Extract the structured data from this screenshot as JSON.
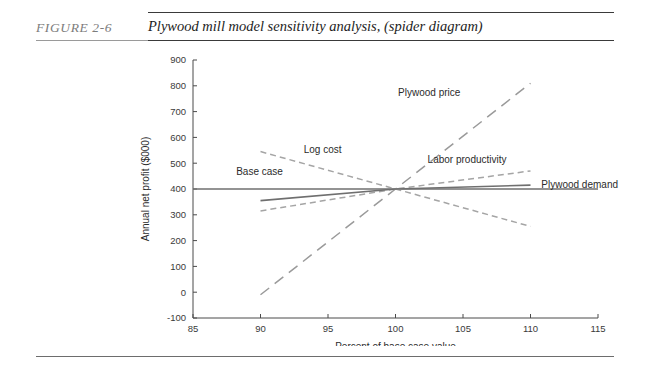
{
  "figure": {
    "number": "FIGURE  2-6",
    "caption": "Plywood mill model sensitivity analysis, (spider diagram)"
  },
  "chart_data": {
    "type": "line",
    "title": "Plywood mill model sensitivity analysis, (spider diagram)",
    "xlabel": "Percent of base case value",
    "ylabel": "Annual net profit ($000)",
    "xlim": [
      85,
      115
    ],
    "ylim": [
      -100,
      900
    ],
    "xticks": [
      85,
      90,
      95,
      100,
      105,
      110,
      115
    ],
    "xtick_labels": [
      "85",
      "90",
      "95",
      "100",
      "105",
      "110",
      "115"
    ],
    "yticks": [
      -100,
      0,
      100,
      200,
      300,
      400,
      500,
      600,
      700,
      800,
      900
    ],
    "ytick_labels": [
      "-100",
      "0",
      "100",
      "200",
      "300",
      "400",
      "500",
      "600",
      "700",
      "800",
      "900"
    ],
    "grid": false,
    "legend": "inline-annotations",
    "base_case_value": 400,
    "series": [
      {
        "name": "Base case",
        "label": "Base case",
        "style": "solid",
        "color": "#6f6f6f",
        "x": [
          85,
          115
        ],
        "y": [
          400,
          400
        ],
        "label_x": 88.2,
        "label_y": 455
      },
      {
        "name": "Plywood price",
        "label": "Plywood price",
        "style": "dashed-long",
        "color": "#9a9a9a",
        "x": [
          90,
          100,
          110
        ],
        "y": [
          -10,
          400,
          810
        ],
        "label_x": 102.5,
        "label_y": 760
      },
      {
        "name": "Log cost",
        "label": "Log cost",
        "style": "dashed-short",
        "color": "#a5a5a5",
        "x": [
          90,
          100,
          110
        ],
        "y": [
          545,
          400,
          255
        ],
        "label_x": 94.6,
        "label_y": 540
      },
      {
        "name": "Labor productivity",
        "label": "Labor productivity",
        "style": "dashed-short",
        "color": "#a5a5a5",
        "x": [
          90,
          100,
          110
        ],
        "y": [
          315,
          400,
          470
        ],
        "label_x": 105.3,
        "label_y": 500
      },
      {
        "name": "Plywood demand",
        "label": "Plywood demand",
        "style": "solid",
        "color": "#6f6f6f",
        "x": [
          90,
          100,
          110
        ],
        "y": [
          355,
          400,
          415
        ],
        "label_x": 110.8,
        "label_y": 405
      }
    ]
  }
}
